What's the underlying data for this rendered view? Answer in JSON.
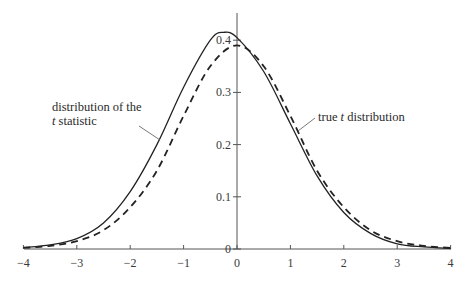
{
  "chart_data": {
    "type": "line",
    "title": "",
    "xlabel": "",
    "ylabel": "",
    "xlim": [
      -4,
      4
    ],
    "ylim": [
      0,
      0.45
    ],
    "grid": false,
    "x_ticks": [
      -4,
      -3,
      -2,
      -1,
      0,
      1,
      2,
      3,
      4
    ],
    "x_tick_labels": [
      "−4",
      "−3",
      "−2",
      "−1",
      "0",
      "1",
      "2",
      "3",
      "4"
    ],
    "y_ticks": [
      0,
      0.1,
      0.2,
      0.3,
      0.4
    ],
    "y_tick_labels": [
      "0",
      "0.1",
      "0.2",
      "0.3",
      "0.4"
    ],
    "series": [
      {
        "name": "distribution of the t statistic",
        "style": "solid",
        "x": [
          -4,
          -3.5,
          -3,
          -2.5,
          -2,
          -1.5,
          -1,
          -0.5,
          -0.25,
          0,
          0.5,
          1,
          1.5,
          2,
          2.5,
          3,
          3.5,
          4
        ],
        "y": [
          0.003,
          0.008,
          0.02,
          0.05,
          0.11,
          0.2,
          0.31,
          0.4,
          0.415,
          0.405,
          0.34,
          0.24,
          0.14,
          0.07,
          0.03,
          0.01,
          0.004,
          0.001
        ]
      },
      {
        "name": "true t distribution",
        "style": "dashed",
        "x": [
          -4,
          -3.5,
          -3,
          -2.5,
          -2,
          -1.5,
          -1,
          -0.5,
          0,
          0.5,
          1,
          1.5,
          2,
          2.5,
          3,
          3.5,
          4
        ],
        "y": [
          0.002,
          0.006,
          0.015,
          0.036,
          0.08,
          0.15,
          0.255,
          0.35,
          0.39,
          0.35,
          0.255,
          0.15,
          0.08,
          0.036,
          0.015,
          0.006,
          0.002
        ]
      }
    ],
    "annotations": [
      {
        "text_line1": "distribution of the",
        "text_line2_italic": "t",
        "text_line2_rest": " statistic",
        "points_to": "solid curve near x=-1.3"
      },
      {
        "text_italic_prefix": "true ",
        "text_italic": "t",
        "text_rest": " distribution",
        "points_to": "dashed curve near x=1.1"
      }
    ]
  },
  "labels": {
    "left_line1": "distribution of the",
    "left_line2_italic": "t",
    "left_line2_rest": " statistic",
    "right_prefix": "true ",
    "right_italic": "t",
    "right_rest": " distribution"
  }
}
